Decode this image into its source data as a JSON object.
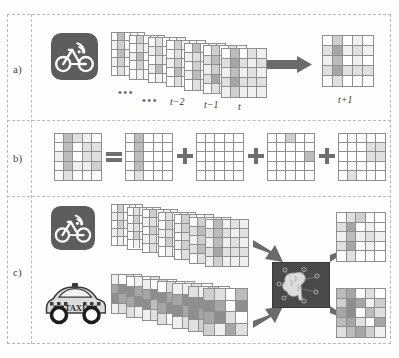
{
  "figure": {
    "panels": [
      {
        "id": "a",
        "label": "a)"
      },
      {
        "id": "b",
        "label": "b)"
      },
      {
        "id": "c",
        "label": "c)"
      }
    ]
  },
  "panel_a": {
    "label": "a)",
    "source_icon": "bicycle-wifi-icon",
    "ellipsis_1": "•••",
    "ellipsis_2": "•••",
    "timesteps": [
      "t−2",
      "t−1",
      "t"
    ],
    "output_label": "t+1",
    "arrow_icon": "right-arrow-icon",
    "grid_rows": 5,
    "grid_cols": 5,
    "stack_count": 7,
    "output_grid": [
      [
        0,
        3,
        0,
        1,
        0
      ],
      [
        2,
        5,
        1,
        2,
        1
      ],
      [
        1,
        4,
        0,
        1,
        0
      ],
      [
        2,
        5,
        2,
        2,
        2
      ],
      [
        0,
        2,
        0,
        0,
        0
      ]
    ],
    "stack_grids": [
      [
        [
          0,
          4,
          0,
          0,
          0
        ],
        [
          1,
          3,
          0,
          1,
          0
        ],
        [
          0,
          4,
          1,
          0,
          1
        ],
        [
          1,
          3,
          0,
          1,
          0
        ],
        [
          0,
          2,
          0,
          0,
          0
        ]
      ],
      [
        [
          0,
          3,
          0,
          1,
          0
        ],
        [
          0,
          2,
          1,
          0,
          0
        ],
        [
          1,
          4,
          0,
          1,
          0
        ],
        [
          0,
          3,
          0,
          0,
          1
        ],
        [
          0,
          1,
          0,
          0,
          0
        ]
      ],
      [
        [
          0,
          2,
          0,
          0,
          1
        ],
        [
          1,
          3,
          0,
          1,
          0
        ],
        [
          0,
          2,
          1,
          0,
          0
        ],
        [
          1,
          4,
          0,
          1,
          0
        ],
        [
          0,
          1,
          0,
          0,
          0
        ]
      ],
      [
        [
          0,
          3,
          1,
          0,
          0
        ],
        [
          0,
          2,
          0,
          1,
          0
        ],
        [
          1,
          3,
          0,
          0,
          1
        ],
        [
          0,
          4,
          1,
          0,
          0
        ],
        [
          0,
          2,
          0,
          0,
          0
        ]
      ],
      [
        [
          0,
          4,
          0,
          1,
          0
        ],
        [
          1,
          2,
          1,
          0,
          1
        ],
        [
          0,
          3,
          0,
          1,
          0
        ],
        [
          1,
          4,
          0,
          0,
          1
        ],
        [
          0,
          2,
          1,
          0,
          0
        ]
      ],
      [
        [
          0,
          3,
          0,
          2,
          0
        ],
        [
          2,
          4,
          1,
          1,
          1
        ],
        [
          1,
          3,
          0,
          2,
          0
        ],
        [
          2,
          5,
          1,
          1,
          1
        ],
        [
          0,
          2,
          0,
          1,
          0
        ]
      ],
      [
        [
          0,
          4,
          0,
          2,
          1
        ],
        [
          2,
          5,
          2,
          1,
          2
        ],
        [
          1,
          4,
          1,
          2,
          1
        ],
        [
          2,
          5,
          2,
          2,
          2
        ],
        [
          1,
          3,
          1,
          1,
          1
        ]
      ]
    ]
  },
  "panel_b": {
    "label": "b)",
    "equals_symbol": "=",
    "plus_symbol": "+",
    "term_count": 4,
    "grid_rows": 5,
    "grid_cols": 5,
    "result_grid": [
      [
        0,
        4,
        2,
        1,
        0
      ],
      [
        0,
        4,
        0,
        2,
        2
      ],
      [
        1,
        4,
        0,
        2,
        2
      ],
      [
        0,
        4,
        1,
        1,
        3
      ],
      [
        0,
        2,
        0,
        0,
        0
      ]
    ],
    "term_grids": [
      [
        [
          0,
          4,
          0,
          0,
          0
        ],
        [
          0,
          4,
          0,
          0,
          0
        ],
        [
          0,
          4,
          0,
          0,
          0
        ],
        [
          0,
          4,
          0,
          0,
          0
        ],
        [
          0,
          2,
          0,
          0,
          0
        ]
      ],
      [
        [
          0,
          0,
          0,
          0,
          0
        ],
        [
          0,
          0,
          0,
          0,
          0
        ],
        [
          0,
          0,
          0,
          0,
          0
        ],
        [
          0,
          0,
          0,
          0,
          0
        ],
        [
          0,
          0,
          0,
          0,
          0
        ]
      ],
      [
        [
          0,
          0,
          3,
          0,
          0
        ],
        [
          0,
          0,
          0,
          0,
          0
        ],
        [
          0,
          0,
          0,
          0,
          4
        ],
        [
          0,
          0,
          0,
          0,
          0
        ],
        [
          0,
          0,
          0,
          0,
          0
        ]
      ],
      [
        [
          0,
          0,
          0,
          0,
          0
        ],
        [
          0,
          0,
          0,
          2,
          2
        ],
        [
          0,
          0,
          0,
          2,
          2
        ],
        [
          0,
          0,
          0,
          0,
          0
        ],
        [
          0,
          2,
          0,
          0,
          0
        ]
      ]
    ]
  },
  "panel_c": {
    "label": "c)",
    "bike_icon": "bicycle-wifi-icon",
    "taxi_icon": "taxi-icon",
    "taxi_text": "TAXI",
    "model_icon": "brain-neural-network-icon",
    "arrow_icon": "thick-arrow-icon",
    "bike_grid_rows": 5,
    "bike_grid_cols": 5,
    "taxi_grid_rows": 4,
    "taxi_grid_cols": 4,
    "bike_stack_count": 7,
    "taxi_stack_count": 7,
    "bike_stack_grids": [
      [
        [
          0,
          3,
          0,
          1,
          0
        ],
        [
          1,
          2,
          0,
          0,
          1
        ],
        [
          0,
          3,
          1,
          1,
          0
        ],
        [
          1,
          2,
          0,
          0,
          1
        ],
        [
          0,
          1,
          0,
          0,
          0
        ]
      ],
      [
        [
          0,
          2,
          1,
          0,
          0
        ],
        [
          0,
          3,
          0,
          1,
          0
        ],
        [
          1,
          2,
          0,
          0,
          1
        ],
        [
          0,
          3,
          1,
          1,
          0
        ],
        [
          0,
          1,
          0,
          0,
          0
        ]
      ],
      [
        [
          0,
          3,
          0,
          1,
          1
        ],
        [
          1,
          2,
          1,
          0,
          0
        ],
        [
          0,
          3,
          0,
          1,
          0
        ],
        [
          1,
          2,
          1,
          0,
          1
        ],
        [
          0,
          2,
          0,
          0,
          0
        ]
      ],
      [
        [
          0,
          2,
          0,
          1,
          0
        ],
        [
          0,
          3,
          1,
          0,
          1
        ],
        [
          1,
          2,
          0,
          1,
          0
        ],
        [
          0,
          3,
          1,
          0,
          1
        ],
        [
          0,
          1,
          0,
          0,
          0
        ]
      ],
      [
        [
          0,
          3,
          1,
          0,
          1
        ],
        [
          1,
          3,
          0,
          1,
          0
        ],
        [
          0,
          2,
          1,
          1,
          0
        ],
        [
          1,
          3,
          0,
          1,
          1
        ],
        [
          0,
          2,
          0,
          0,
          0
        ]
      ],
      [
        [
          0,
          3,
          0,
          2,
          1
        ],
        [
          2,
          4,
          1,
          1,
          2
        ],
        [
          1,
          3,
          1,
          2,
          1
        ],
        [
          2,
          4,
          1,
          1,
          2
        ],
        [
          0,
          2,
          1,
          0,
          1
        ]
      ],
      [
        [
          0,
          4,
          1,
          2,
          1
        ],
        [
          2,
          4,
          2,
          1,
          2
        ],
        [
          1,
          4,
          1,
          2,
          1
        ],
        [
          2,
          5,
          2,
          2,
          2
        ],
        [
          1,
          3,
          1,
          1,
          1
        ]
      ]
    ],
    "taxi_stack_grids": [
      [
        [
          1,
          0,
          2,
          0
        ],
        [
          5,
          6,
          3,
          1
        ],
        [
          6,
          5,
          2,
          0
        ],
        [
          1,
          2,
          0,
          1
        ]
      ],
      [
        [
          0,
          1,
          0,
          2
        ],
        [
          6,
          5,
          4,
          1
        ],
        [
          5,
          6,
          1,
          0
        ],
        [
          2,
          1,
          1,
          0
        ]
      ],
      [
        [
          1,
          0,
          3,
          0
        ],
        [
          5,
          6,
          2,
          1
        ],
        [
          6,
          4,
          3,
          1
        ],
        [
          1,
          2,
          0,
          0
        ]
      ],
      [
        [
          0,
          2,
          0,
          1
        ],
        [
          6,
          5,
          3,
          0
        ],
        [
          5,
          6,
          2,
          1
        ],
        [
          2,
          0,
          1,
          1
        ]
      ],
      [
        [
          1,
          1,
          2,
          0
        ],
        [
          5,
          6,
          4,
          1
        ],
        [
          6,
          5,
          3,
          0
        ],
        [
          1,
          2,
          1,
          1
        ]
      ],
      [
        [
          2,
          1,
          3,
          0
        ],
        [
          6,
          6,
          4,
          2
        ],
        [
          6,
          5,
          3,
          1
        ],
        [
          2,
          3,
          1,
          2
        ]
      ],
      [
        [
          3,
          2,
          0,
          4
        ],
        [
          6,
          5,
          0,
          6
        ],
        [
          5,
          6,
          2,
          0
        ],
        [
          3,
          1,
          5,
          2
        ]
      ]
    ],
    "output_top_grid": [
      [
        0,
        2,
        3,
        0,
        0
      ],
      [
        2,
        5,
        0,
        1,
        0
      ],
      [
        1,
        4,
        1,
        2,
        1
      ],
      [
        2,
        5,
        0,
        1,
        0
      ],
      [
        0,
        2,
        0,
        0,
        0
      ]
    ],
    "output_bottom_grid": [
      [
        4,
        5,
        0,
        2,
        0
      ],
      [
        3,
        6,
        5,
        1,
        3
      ],
      [
        5,
        6,
        0,
        4,
        2
      ],
      [
        4,
        5,
        2,
        0,
        5
      ],
      [
        2,
        4,
        5,
        3,
        1
      ]
    ]
  }
}
